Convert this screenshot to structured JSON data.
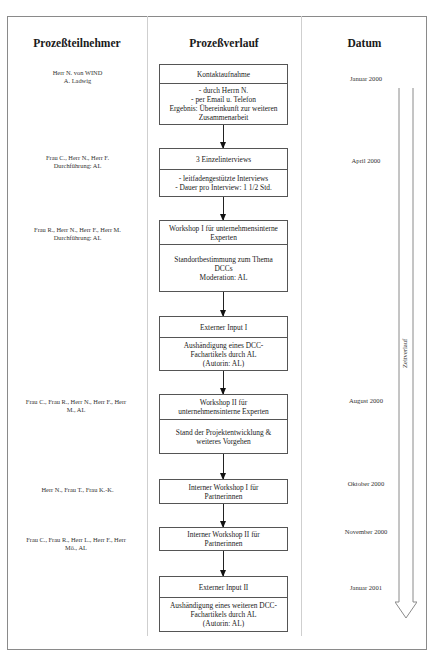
{
  "headers": {
    "participants": "Prozeßteilnehmer",
    "process": "Prozeßverlauf",
    "date": "Datum"
  },
  "time_arrow_label": "Zeitverlauf",
  "steps": [
    {
      "participants": [
        "Herr N. von WIND",
        "A. Ladwig"
      ],
      "title": [
        "Kontaktaufnahme"
      ],
      "details": [
        "- durch Herrn N.",
        "- per Email u. Telefon",
        "Ergebnis: Übereinkunft zur weiteren",
        "Zusammenarbeit"
      ],
      "date": "Januar 2000"
    },
    {
      "participants": [
        "Frau C., Herr N., Herr F.",
        "Durchführung: AL"
      ],
      "title": [
        "3 Einzelinterviews"
      ],
      "details": [
        "- leitfadengestützte Interviews",
        "- Dauer pro Interview: 1 1/2 Std."
      ],
      "date": "April 2000"
    },
    {
      "participants": [
        "Frau R., Herr N., Herr F., Herr M.",
        "Durchführung: AL"
      ],
      "title": [
        "Workshop I für unternehmensinterne",
        "Experten"
      ],
      "details": [
        "Standortbestimmung zum Thema",
        "DCCs",
        "Moderation: AL"
      ],
      "date": ""
    },
    {
      "participants": [],
      "title": [
        "Externer Input I"
      ],
      "details": [
        "Aushändigung eines DCC-",
        "Fachartikels durch AL",
        "(Autorin: AL)"
      ],
      "date": ""
    },
    {
      "participants": [
        "Frau C., Frau R., Herr N., Herr F., Herr",
        "M., AL"
      ],
      "title": [
        "Workshop II für",
        "unternehmensinterne Experten"
      ],
      "details": [
        "Stand der Projektentwicklung &",
        "weiteres Vorgehen"
      ],
      "date": "August 2000"
    },
    {
      "participants": [
        "Herr N., Frau T., Frau K.-K."
      ],
      "title": [
        "Interner Workshop I für",
        "Partnerinnen"
      ],
      "details": [],
      "date": "Oktober 2000"
    },
    {
      "participants": [
        "Frau C., Frau R., Herr L., Herr F., Herr",
        "Mö., AL"
      ],
      "title": [
        "Interner Workshop II für",
        "Partnerinnen"
      ],
      "details": [],
      "date": "November 2000"
    },
    {
      "participants": [],
      "title": [
        "Externer Input II"
      ],
      "details": [
        "Aushändigung eines weiteren DCC-",
        "Fachartikels durch AL",
        "(Autorin: AL)"
      ],
      "date": "Januar 2001"
    }
  ]
}
